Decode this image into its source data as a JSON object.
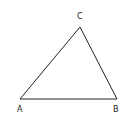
{
  "diagram": {
    "type": "triangle",
    "stroke_color": "#222222",
    "vertices": [
      {
        "label": "A",
        "x": 20,
        "y": 99
      },
      {
        "label": "B",
        "x": 117,
        "y": 99
      },
      {
        "label": "C",
        "x": 80,
        "y": 27
      }
    ],
    "labels": {
      "a": "A",
      "b": "B",
      "c": "C"
    }
  }
}
